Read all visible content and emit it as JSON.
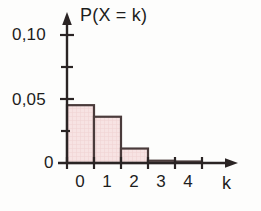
{
  "chart_data": {
    "type": "bar",
    "title": "",
    "subtitle": "",
    "xlabel": "k",
    "ylabel": "P(X = k)",
    "categories": [
      "0",
      "1",
      "2",
      "3",
      "4"
    ],
    "values": [
      0.05,
      0.04,
      0.0125,
      0.002,
      0.0005
    ],
    "x": [
      0,
      1,
      2,
      3,
      4
    ],
    "xlim": [
      -0.5,
      5.2
    ],
    "ylim": [
      0,
      0.115
    ],
    "y_tick_values": [
      0,
      0.025,
      0.05,
      0.075,
      0.1
    ],
    "y_tick_labels": [
      "0",
      "",
      "0,05",
      "",
      "0,10"
    ],
    "x_tick_labels": [
      "0",
      "1",
      "2",
      "3",
      "4"
    ],
    "grid": false,
    "legend": null,
    "annotations": [],
    "bar_fill_color": "#f6dede",
    "bar_edge_color": "#4a3b3b",
    "axis_color": "#2a2424",
    "background_color": "#fdfdfc"
  },
  "axes": {
    "y_axis_title": "P(X = k)",
    "x_axis_title": "k",
    "y_ticks": [
      {
        "label": "0,10",
        "value": 0.1
      },
      {
        "label": "0,05",
        "value": 0.05
      },
      {
        "label": "0",
        "value": 0
      }
    ],
    "x_ticks": [
      {
        "label": "0",
        "value": 0
      },
      {
        "label": "1",
        "value": 1
      },
      {
        "label": "2",
        "value": 2
      },
      {
        "label": "3",
        "value": 3
      },
      {
        "label": "4",
        "value": 4
      }
    ]
  }
}
